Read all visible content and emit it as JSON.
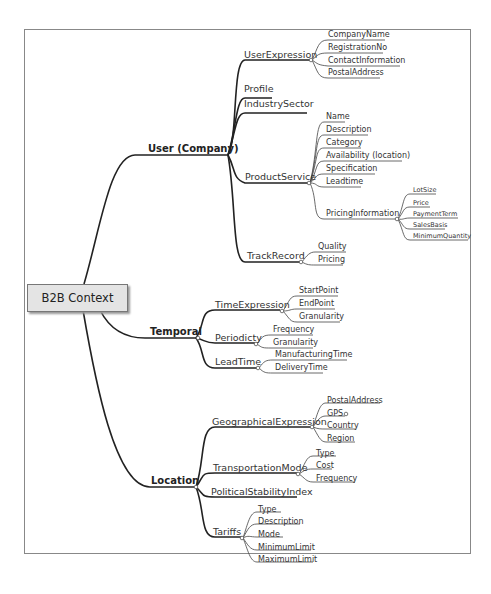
{
  "root": {
    "label": "B2B Context"
  },
  "branches": [
    {
      "label": "User (Company)",
      "children": [
        {
          "label": "UserExpression",
          "children": [
            "CompanyName",
            "RegistrationNo",
            "ContactInformation",
            "PostalAddress"
          ]
        },
        {
          "label": "Profile",
          "children": []
        },
        {
          "label": "IndustrySector",
          "children": []
        },
        {
          "label": "ProductService",
          "children": [
            "Name",
            "Description",
            "Category",
            "Availability (location)",
            "Specification",
            "Leadtime"
          ],
          "sub": {
            "label": "PricingInformation",
            "children": [
              "LotSize",
              "Price",
              "PaymentTerm",
              "SalesBasis",
              "MinimumQuantity"
            ]
          }
        },
        {
          "label": "TrackRecord",
          "children": [
            "Quality",
            "Pricing"
          ]
        }
      ]
    },
    {
      "label": "Temporal",
      "children": [
        {
          "label": "TimeExpression",
          "children": [
            "StartPoint",
            "EndPoint",
            "Granularity"
          ]
        },
        {
          "label": "Periodicty",
          "children": [
            "Frequency",
            "Granularity"
          ]
        },
        {
          "label": "LeadTime",
          "children": [
            "ManufacturingTime",
            "DeliveryTime"
          ]
        }
      ]
    },
    {
      "label": "Location",
      "children": [
        {
          "label": "GeographicalExpression",
          "children": [
            "PostalAddress",
            "GPS",
            "Country",
            "Region"
          ]
        },
        {
          "label": "TransportationMode",
          "children": [
            "Type",
            "Cost",
            "Frequency"
          ]
        },
        {
          "label": "PoliticalStabilityIndex",
          "children": []
        },
        {
          "label": "Tariffs",
          "children": [
            "Type",
            "Description",
            "Mode",
            "MinimumLimit",
            "MaximumLimit"
          ]
        }
      ]
    }
  ]
}
